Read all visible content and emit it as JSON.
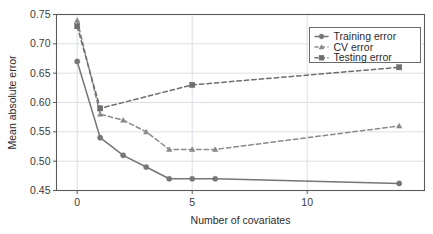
{
  "chart_data": {
    "type": "line",
    "title": "",
    "xlabel": "Number of covariates",
    "ylabel": "Mean absolute error",
    "xlim": [
      -0.9,
      15.1
    ],
    "ylim": [
      0.45,
      0.75
    ],
    "xticks": [
      0,
      5,
      10
    ],
    "xtick_labels": [
      "0",
      "5",
      "10"
    ],
    "yticks": [
      0.45,
      0.5,
      0.55,
      0.6,
      0.65,
      0.7,
      0.75
    ],
    "ytick_labels": [
      "0.45",
      "0.50",
      "0.55",
      "0.60",
      "0.65",
      "0.70",
      "0.75"
    ],
    "grid": true,
    "legend_position": "top-right",
    "series": [
      {
        "name": "Training error",
        "linestyle": "solid",
        "marker": "circle",
        "color": "#767676",
        "x": [
          0,
          1,
          2,
          3,
          4,
          5,
          6,
          14
        ],
        "values": [
          0.67,
          0.54,
          0.51,
          0.49,
          0.47,
          0.47,
          0.47,
          0.462
        ]
      },
      {
        "name": "CV error",
        "linestyle": "dashed",
        "marker": "triangle",
        "color": "#8a8a8a",
        "x": [
          0,
          1,
          2,
          3,
          4,
          5,
          6,
          14
        ],
        "values": [
          0.74,
          0.58,
          0.57,
          0.55,
          0.52,
          0.52,
          0.52,
          0.56
        ]
      },
      {
        "name": "Testing error",
        "linestyle": "dashed",
        "marker": "square",
        "color": "#6e6e6e",
        "x": [
          0,
          1,
          5,
          14
        ],
        "values": [
          0.73,
          0.59,
          0.63,
          0.66
        ]
      }
    ]
  },
  "legend": {
    "entries": [
      {
        "label": "Training error"
      },
      {
        "label": "CV error"
      },
      {
        "label": "Testing error"
      }
    ]
  },
  "colors": {
    "axis": "#5a5a5a",
    "grid": "#d8dde3",
    "text": "#2b2b2b",
    "line": "#767676",
    "legend_border": "#6b6b6b",
    "legend_background": "#ffffff"
  }
}
